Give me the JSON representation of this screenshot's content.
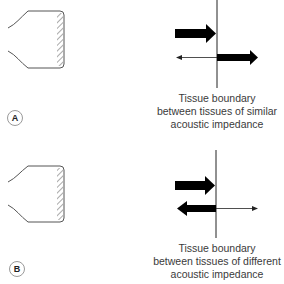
{
  "panels": [
    {
      "id": "A",
      "label": "A",
      "caption_lines": [
        "Tissue boundary",
        "between tissues of similar",
        "acoustic impedance"
      ],
      "incident_arrow": "thick, left to boundary",
      "reflected_arrow": "thin, small (weak echo)",
      "transmitted_arrow": "thick (strong transmission)"
    },
    {
      "id": "B",
      "label": "B",
      "caption_lines": [
        "Tissue boundary",
        "between tissues of different",
        "acoustic impedance"
      ],
      "incident_arrow": "thick, left to boundary",
      "reflected_arrow": "thick (strong echo)",
      "transmitted_arrow": "thin (weak transmission)"
    }
  ],
  "colors": {
    "line": "#222222",
    "outline": "#555555",
    "text": "#3a3a3a"
  }
}
